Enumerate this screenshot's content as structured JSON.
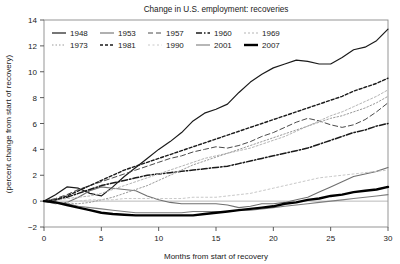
{
  "chart_data": {
    "type": "line",
    "title": "Change in U.S. employment: recoveries",
    "xlabel": "Months from start of recovery",
    "ylabel": "(percent change from start of recovery)",
    "xlim": [
      0,
      30
    ],
    "ylim": [
      -2,
      14
    ],
    "xticks": [
      0,
      5,
      10,
      15,
      20,
      25,
      30
    ],
    "yticks": [
      -2,
      0,
      2,
      4,
      6,
      8,
      10,
      12,
      14
    ],
    "grid": false,
    "legend_position": "top-left-inside",
    "zero_line": 0,
    "x": [
      0,
      1,
      2,
      3,
      4,
      5,
      6,
      7,
      8,
      9,
      10,
      11,
      12,
      13,
      14,
      15,
      16,
      17,
      18,
      19,
      20,
      21,
      22,
      23,
      24,
      25,
      26,
      27,
      28,
      29,
      30
    ],
    "series": [
      {
        "name": "1948",
        "color": "#1a1a1a",
        "width": 1.2,
        "dash": "none",
        "values": [
          0,
          0.5,
          1.1,
          1.0,
          0.6,
          0.4,
          1.1,
          1.9,
          2.6,
          3.3,
          4.0,
          4.6,
          5.3,
          6.2,
          6.8,
          7.1,
          7.5,
          8.4,
          9.2,
          9.8,
          10.3,
          10.6,
          10.9,
          10.8,
          10.6,
          10.6,
          11.1,
          11.7,
          11.9,
          12.4,
          13.3
        ]
      },
      {
        "name": "1953",
        "color": "#6f6f6f",
        "width": 1.1,
        "dash": "none",
        "values": [
          0,
          -0.2,
          -0.1,
          0.3,
          0.8,
          1.1,
          1.0,
          0.9,
          0.8,
          0.4,
          0.1,
          -0.1,
          -0.2,
          -0.2,
          -0.2,
          -0.2,
          -0.3,
          -0.5,
          -0.4,
          -0.2,
          -0.2,
          -0.1,
          0.1,
          0.3,
          0.7,
          1.1,
          1.5,
          1.9,
          2.1,
          2.3,
          2.6
        ]
      },
      {
        "name": "1957",
        "color": "#4a4a4a",
        "width": 1.0,
        "dash": "5,3",
        "values": [
          0,
          0.2,
          0.5,
          0.9,
          1.2,
          1.5,
          1.8,
          2.1,
          2.4,
          2.7,
          3.0,
          3.3,
          3.5,
          3.8,
          4.0,
          4.2,
          4.1,
          4.3,
          4.6,
          5.0,
          5.3,
          5.7,
          6.1,
          6.4,
          6.2,
          5.9,
          5.7,
          5.9,
          6.3,
          6.9,
          7.6
        ]
      },
      {
        "name": "1960",
        "color": "#1a1a1a",
        "width": 1.5,
        "dash": "6,2,1.5,2",
        "values": [
          0,
          0.1,
          0.3,
          0.6,
          0.9,
          1.2,
          1.4,
          1.6,
          1.8,
          2.0,
          2.1,
          2.2,
          2.3,
          2.4,
          2.5,
          2.6,
          2.7,
          2.9,
          3.1,
          3.3,
          3.5,
          3.7,
          3.9,
          4.1,
          4.4,
          4.7,
          5.0,
          5.3,
          5.5,
          5.8,
          6.0
        ]
      },
      {
        "name": "1969",
        "color": "#b5b5b5",
        "width": 1.0,
        "dash": "2,2",
        "values": [
          0,
          0.1,
          0.2,
          0.3,
          0.4,
          0.6,
          0.9,
          1.2,
          1.5,
          1.8,
          2.1,
          2.4,
          2.7,
          3.0,
          3.3,
          3.5,
          3.7,
          3.9,
          4.1,
          4.4,
          4.7,
          5.0,
          5.4,
          5.8,
          6.2,
          6.6,
          6.9,
          7.3,
          7.7,
          8.1,
          8.6
        ]
      },
      {
        "name": "1973",
        "color": "#9a9a9a",
        "width": 1.0,
        "dash": "1.5,2",
        "values": [
          0,
          -0.1,
          -0.2,
          -0.2,
          -0.1,
          0.1,
          0.3,
          0.6,
          0.9,
          1.2,
          1.6,
          2.0,
          2.4,
          2.8,
          3.1,
          3.4,
          3.7,
          4.0,
          4.3,
          4.6,
          4.9,
          5.2,
          5.5,
          5.8,
          6.1,
          6.4,
          6.6,
          6.9,
          7.2,
          7.6,
          8.1
        ]
      },
      {
        "name": "1981",
        "color": "#1a1a1a",
        "width": 1.4,
        "dash": "3,2",
        "values": [
          0,
          0.1,
          0.4,
          0.8,
          1.2,
          1.6,
          2.0,
          2.4,
          2.7,
          3.0,
          3.3,
          3.6,
          3.9,
          4.2,
          4.5,
          4.8,
          5.1,
          5.4,
          5.7,
          6.0,
          6.3,
          6.6,
          6.9,
          7.2,
          7.5,
          7.8,
          8.1,
          8.5,
          8.8,
          9.1,
          9.5
        ]
      },
      {
        "name": "1990",
        "color": "#c8c8c8",
        "width": 1.0,
        "dash": "2,2.5",
        "values": [
          0,
          -0.1,
          -0.1,
          0.0,
          0.1,
          0.1,
          0.1,
          0.2,
          0.2,
          0.2,
          0.2,
          0.2,
          0.2,
          0.3,
          0.3,
          0.3,
          0.4,
          0.5,
          0.6,
          0.8,
          1.0,
          1.2,
          1.4,
          1.6,
          1.8,
          1.9,
          2.0,
          2.1,
          2.2,
          2.3,
          2.4
        ]
      },
      {
        "name": "2001",
        "color": "#7d7d7d",
        "width": 1.1,
        "dash": "none",
        "values": [
          0,
          -0.1,
          -0.2,
          -0.4,
          -0.5,
          -0.6,
          -0.7,
          -0.8,
          -0.9,
          -0.9,
          -0.9,
          -0.9,
          -0.9,
          -0.8,
          -0.8,
          -0.8,
          -0.8,
          -0.7,
          -0.7,
          -0.6,
          -0.5,
          -0.4,
          -0.3,
          -0.2,
          -0.1,
          0.0,
          0.1,
          0.2,
          0.3,
          0.4,
          0.5
        ]
      },
      {
        "name": "2007",
        "color": "#000000",
        "width": 2.4,
        "dash": "none",
        "values": [
          0,
          -0.1,
          -0.3,
          -0.5,
          -0.7,
          -0.9,
          -1.0,
          -1.05,
          -1.1,
          -1.1,
          -1.1,
          -1.1,
          -1.1,
          -1.1,
          -1.0,
          -0.9,
          -0.8,
          -0.7,
          -0.6,
          -0.5,
          -0.4,
          -0.2,
          -0.1,
          0.1,
          0.2,
          0.4,
          0.5,
          0.7,
          0.8,
          0.9,
          1.1
        ]
      }
    ],
    "legend_rows": [
      [
        "1948",
        "1953",
        "1957",
        "1960",
        "1969"
      ],
      [
        "1973",
        "1981",
        "1990",
        "2001",
        "2007"
      ]
    ]
  }
}
